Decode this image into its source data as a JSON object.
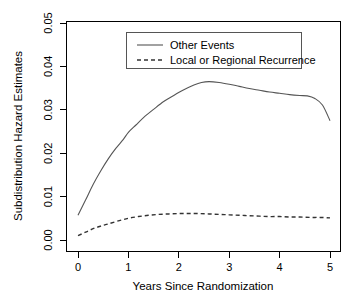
{
  "chart_data": {
    "type": "line",
    "title": "",
    "xlabel": "Years Since Randomization",
    "ylabel": "Subdistribution Hazard Estimates",
    "xlim": [
      0,
      5
    ],
    "ylim": [
      0.0,
      0.05
    ],
    "xticks": [
      0,
      1,
      2,
      3,
      4,
      5
    ],
    "xtick_labels": [
      "0",
      "1",
      "2",
      "3",
      "4",
      "5"
    ],
    "yticks": [
      0.0,
      0.01,
      0.02,
      0.03,
      0.04,
      0.05
    ],
    "ytick_labels": [
      "0.00",
      "0.01",
      "0.02",
      "0.03",
      "0.04",
      "0.05"
    ],
    "grid": false,
    "legend_position": "top-center",
    "series": [
      {
        "name": "Other Events",
        "style": "solid",
        "color": "#555555",
        "x": [
          0.0,
          0.15,
          0.3,
          0.45,
          0.6,
          0.75,
          0.9,
          1.0,
          1.15,
          1.3,
          1.5,
          1.7,
          1.9,
          2.1,
          2.3,
          2.45,
          2.6,
          2.8,
          3.0,
          3.2,
          3.4,
          3.6,
          3.8,
          4.0,
          4.2,
          4.4,
          4.55,
          4.7,
          4.85,
          5.0
        ],
        "y": [
          0.0057,
          0.0092,
          0.0128,
          0.0159,
          0.0187,
          0.0211,
          0.0232,
          0.0248,
          0.0265,
          0.0282,
          0.0301,
          0.0319,
          0.0333,
          0.0346,
          0.0357,
          0.0363,
          0.0365,
          0.0363,
          0.0359,
          0.0354,
          0.0349,
          0.0345,
          0.0341,
          0.0338,
          0.0335,
          0.0333,
          0.0332,
          0.0326,
          0.0311,
          0.0275
        ]
      },
      {
        "name": "Local or Regional Recurrence",
        "style": "dashed",
        "color": "#333333",
        "x": [
          0.0,
          0.15,
          0.3,
          0.45,
          0.6,
          0.8,
          1.0,
          1.2,
          1.4,
          1.6,
          1.8,
          2.0,
          2.2,
          2.4,
          2.6,
          2.8,
          3.0,
          3.2,
          3.4,
          3.6,
          3.8,
          4.0,
          4.2,
          4.4,
          4.6,
          4.8,
          5.0
        ],
        "y": [
          0.001,
          0.0018,
          0.0026,
          0.0032,
          0.0037,
          0.0044,
          0.005,
          0.0054,
          0.0057,
          0.0059,
          0.006,
          0.0061,
          0.0061,
          0.0061,
          0.006,
          0.0059,
          0.0058,
          0.0057,
          0.0056,
          0.0055,
          0.0054,
          0.0054,
          0.0053,
          0.0053,
          0.0052,
          0.0052,
          0.0051
        ]
      }
    ],
    "legend_entries": [
      {
        "label": "Other Events",
        "style": "solid"
      },
      {
        "label": "Local or Regional Recurrence",
        "style": "dashed"
      }
    ]
  }
}
